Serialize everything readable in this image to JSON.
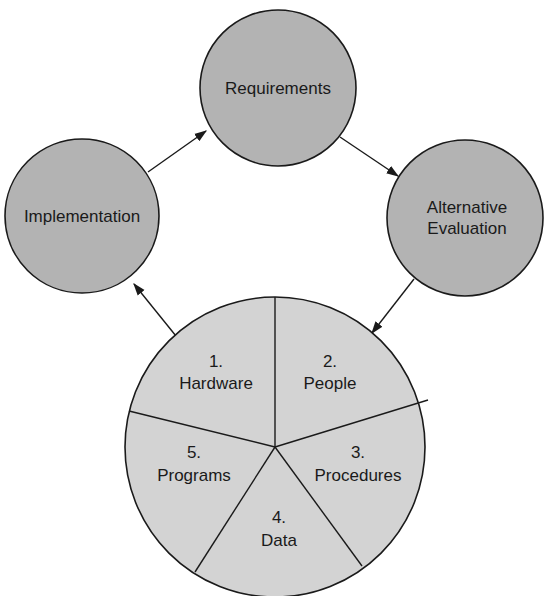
{
  "diagram": {
    "type": "cycle",
    "colors": {
      "stage_fill": "#b3b3b3",
      "pie_fill": "#d3d3d3",
      "stroke": "#1a1a1a",
      "background": "#ffffff"
    },
    "stages": [
      {
        "id": "requirements",
        "label": "Requirements"
      },
      {
        "id": "alternative-evaluation",
        "label_line1": "Alternative",
        "label_line2": "Evaluation"
      },
      {
        "id": "components",
        "label": "System components"
      },
      {
        "id": "implementation",
        "label": "Implementation"
      }
    ],
    "flow": [
      "Implementation → Requirements",
      "Requirements → Alternative Evaluation",
      "Alternative Evaluation → Components",
      "Components → Implementation"
    ],
    "components": [
      {
        "number": "1.",
        "label": "Hardware"
      },
      {
        "number": "2.",
        "label": "People"
      },
      {
        "number": "3.",
        "label": "Procedures"
      },
      {
        "number": "4.",
        "label": "Data"
      },
      {
        "number": "5.",
        "label": "Programs"
      }
    ]
  }
}
